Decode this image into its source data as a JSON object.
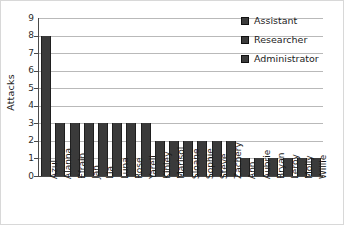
{
  "chart_data": {
    "type": "bar",
    "title": "",
    "xlabel": "",
    "ylabel": "Attacks",
    "ylim": [
      0,
      9
    ],
    "ytick_labels": [
      "9",
      "8",
      "7",
      "6",
      "5",
      "4",
      "3",
      "2",
      "1",
      "0"
    ],
    "grid": true,
    "legend_position": "top-right",
    "bar_color": "#3a3a3a",
    "gridline_color": "#b9b9b9",
    "axis_color": "#4a4a4a",
    "categories": [
      "Azul",
      "Alanna",
      "Efrain",
      "Jan",
      "Lia",
      "Luna",
      "Rose",
      "Yareli",
      "Kinley",
      "Marisol",
      "Sloane",
      "Sophie",
      "Steve",
      "Zachery",
      "Ann",
      "Aubrie",
      "Bryan",
      "Leroy",
      "Molly",
      "Willie"
    ],
    "values": [
      8,
      3,
      3,
      3,
      3,
      3,
      3,
      3,
      2,
      2,
      2,
      2,
      2,
      2,
      1,
      1,
      1,
      1,
      1,
      1
    ],
    "legend": [
      {
        "label": "Assistant",
        "color": "#3c3c3c"
      },
      {
        "label": "Researcher",
        "color": "#3c3c3c"
      },
      {
        "label": "Administrator",
        "color": "#3c3c3c"
      }
    ]
  }
}
